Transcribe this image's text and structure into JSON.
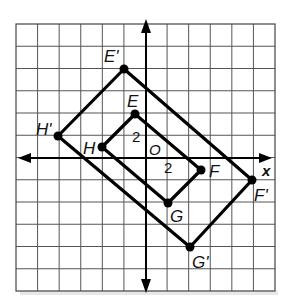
{
  "diagram": {
    "type": "coordinate-plane-dilation",
    "grid": {
      "left": 16,
      "top": 24,
      "right": 275,
      "bottom": 291,
      "cols": 12,
      "rows": 12,
      "origin_px": [
        146,
        158
      ],
      "unit_px": [
        21.6,
        22.2
      ]
    },
    "axes": {
      "x_label": "x",
      "origin_label": "O",
      "x_tick_label": "2",
      "y_tick_label": "2"
    },
    "original": {
      "name": "EFGH",
      "vertices": [
        {
          "label": "E",
          "coords": [
            -0.5,
            2
          ]
        },
        {
          "label": "F",
          "coords": [
            2.5,
            -0.5
          ]
        },
        {
          "label": "G",
          "coords": [
            1,
            -2
          ]
        },
        {
          "label": "H",
          "coords": [
            -2,
            0.5
          ]
        }
      ]
    },
    "image": {
      "name": "E'F'G'H'",
      "vertices": [
        {
          "label": "E'",
          "coords": [
            -1,
            4
          ]
        },
        {
          "label": "F'",
          "coords": [
            5,
            -1
          ]
        },
        {
          "label": "G'",
          "coords": [
            2,
            -4
          ]
        },
        {
          "label": "H'",
          "coords": [
            -4,
            1
          ]
        }
      ]
    },
    "colors": {
      "grid": "#555555",
      "shape": "#000000",
      "background": "#ffffff"
    }
  }
}
